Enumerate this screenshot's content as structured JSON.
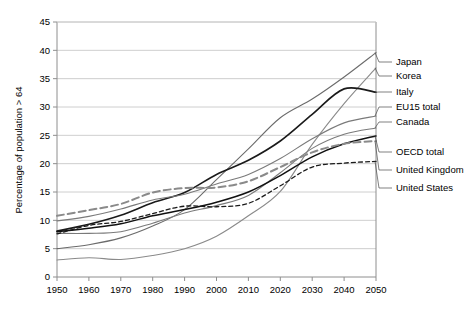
{
  "chart_data": {
    "type": "line",
    "title": "",
    "xlabel": "",
    "ylabel": "Percentage of population > 64",
    "xlim": [
      1950,
      2050
    ],
    "ylim": [
      0,
      45
    ],
    "grid": "horizontal",
    "legend_position": "right-inline-labels",
    "x": [
      1950,
      1960,
      1970,
      1980,
      1990,
      2000,
      2010,
      2020,
      2030,
      2040,
      2050
    ],
    "xticks": [
      "1950",
      "1960",
      "1970",
      "1980",
      "1990",
      "2000",
      "2010",
      "2020",
      "2030",
      "2040",
      "2050"
    ],
    "yticks": [
      "0",
      "5",
      "10",
      "15",
      "20",
      "25",
      "30",
      "35",
      "40",
      "45"
    ],
    "series": [
      {
        "name": "Japan",
        "color": "#6b6b6b",
        "width": 1.1,
        "dash": "none",
        "values": [
          5.0,
          5.7,
          6.9,
          9.0,
          11.9,
          17.2,
          22.6,
          28.1,
          31.4,
          35.3,
          39.6
        ],
        "label_y": 62
      },
      {
        "name": "Korea",
        "color": "#8a8a8a",
        "width": 1.1,
        "dash": "none",
        "values": [
          3.0,
          3.4,
          3.1,
          3.8,
          5.0,
          7.2,
          10.8,
          15.1,
          23.4,
          30.6,
          36.9
        ],
        "label_y": 76
      },
      {
        "name": "Italy",
        "color": "#1a1a1a",
        "width": 1.6,
        "dash": "none",
        "values": [
          8.1,
          9.3,
          10.9,
          13.1,
          14.9,
          18.1,
          20.6,
          24.0,
          28.7,
          33.2,
          32.6
        ],
        "label_y": 92
      },
      {
        "name": "EU15 total",
        "color": "#7a7a7a",
        "width": 1.1,
        "dash": "none",
        "values": [
          9.9,
          10.7,
          12.0,
          13.6,
          14.6,
          16.4,
          18.1,
          20.9,
          24.4,
          27.2,
          28.4
        ],
        "label_y": 107
      },
      {
        "name": "Canada",
        "color": "#7a7a7a",
        "width": 1.1,
        "dash": "none",
        "values": [
          7.7,
          7.7,
          8.0,
          9.5,
          11.3,
          12.6,
          14.4,
          18.4,
          22.7,
          25.2,
          26.3
        ],
        "label_y": 122
      },
      {
        "name": "OECD total",
        "color": "#111111",
        "width": 1.5,
        "dash": "none",
        "values": [
          8.0,
          8.6,
          9.4,
          10.8,
          11.9,
          13.2,
          15.0,
          17.9,
          21.2,
          23.5,
          24.9
        ],
        "label_y": 152
      },
      {
        "name": "United Kingdom",
        "color": "#8a8a8a",
        "width": 2.0,
        "dash": "7,4",
        "values": [
          10.8,
          11.8,
          12.9,
          14.9,
          15.7,
          15.8,
          16.9,
          19.4,
          22.0,
          23.5,
          24.0
        ],
        "label_y": 170
      },
      {
        "name": "United States",
        "color": "#1a1a1a",
        "width": 1.3,
        "dash": "4,3",
        "values": [
          7.6,
          9.1,
          9.8,
          11.2,
          12.5,
          12.4,
          13.0,
          16.1,
          19.4,
          20.1,
          20.4
        ],
        "label_y": 188
      }
    ]
  },
  "axes": {
    "y_axis_title": "Percentage of population > 64"
  }
}
